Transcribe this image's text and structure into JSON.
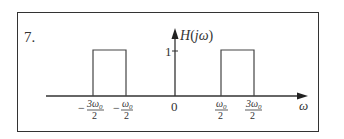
{
  "problem_number": "7.",
  "y_axis_label": "H(jω)",
  "y_axis_label_parts": {
    "H": "H",
    "open": "(",
    "j": "j",
    "omega": "ω",
    "close": ")"
  },
  "x_axis_label": "ω",
  "amplitude_label": "1",
  "origin_label": "0",
  "tick_labels": [
    {
      "sign": "−",
      "numerator": "3ω0",
      "num_main": "3ω",
      "num_sub": "0",
      "denominator": "2"
    },
    {
      "sign": "−",
      "numerator": "ω0",
      "num_main": "ω",
      "num_sub": "0",
      "denominator": "2"
    },
    {
      "sign": "",
      "numerator": "ω0",
      "num_main": "ω",
      "num_sub": "0",
      "denominator": "2"
    },
    {
      "sign": "",
      "numerator": "3ω0",
      "num_main": "3ω",
      "num_sub": "0",
      "denominator": "2"
    }
  ],
  "pulses": [
    {
      "from": "-3ω0/2",
      "to": "-ω0/2",
      "height": 1
    },
    {
      "from": "ω0/2",
      "to": "3ω0/2",
      "height": 1
    }
  ],
  "colors": {
    "stroke": "#333333",
    "background": "#ffffff"
  }
}
